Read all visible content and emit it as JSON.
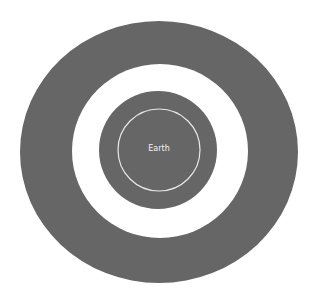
{
  "diagram": {
    "center_label": "Earth",
    "colors": {
      "background": "#ffffff",
      "outer_ring": "#666666",
      "gap_ring": "#ffffff",
      "inner_disk": "#666666",
      "orbit_line": "#e8e8e8",
      "label": "#f2f2f2"
    },
    "shapes": {
      "outer_ellipse": {
        "cx": 159,
        "cy": 152,
        "rx": 139,
        "ry": 131
      },
      "white_ring": {
        "cx": 160,
        "cy": 151,
        "rx": 88,
        "ry": 87
      },
      "inner_disk": {
        "cx": 158,
        "cy": 150,
        "r": 59
      },
      "orbit_circle": {
        "cx": 159,
        "cy": 150,
        "r": 41
      }
    }
  }
}
